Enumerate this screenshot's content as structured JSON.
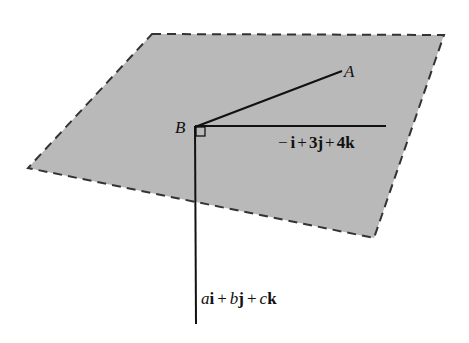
{
  "diagram": {
    "plane": {
      "fill": "#b9b9b9",
      "stroke": "#333333",
      "corners": [
        [
          152,
          34
        ],
        [
          444,
          35
        ],
        [
          374,
          238
        ],
        [
          28,
          168
        ]
      ]
    },
    "point_B": {
      "label": "B",
      "x": 194,
      "y": 127
    },
    "point_A": {
      "label": "A",
      "x": 342,
      "y": 71
    },
    "vector_in_plane": {
      "label_parts": [
        "−",
        "i",
        "+",
        "3",
        "j",
        "+",
        "4",
        "k"
      ],
      "label_text": "−i + 3j + 4k",
      "end": [
        386,
        126
      ]
    },
    "normal_vector": {
      "label_parts": [
        "a",
        "i",
        "+",
        "b",
        "j",
        "+",
        "c",
        "k"
      ],
      "label_text": "ai + bj + ck",
      "end": [
        196,
        324
      ]
    },
    "right_angle_marker": true
  }
}
